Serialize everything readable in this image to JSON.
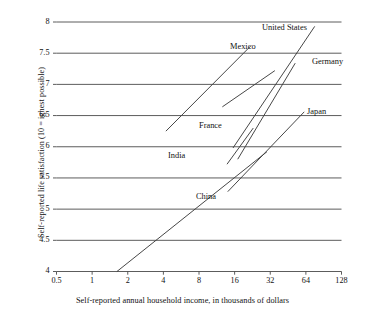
{
  "chart_data": {
    "type": "line",
    "title": "",
    "subtitle": "",
    "xlabel": "Self-reported annual household income, in thousands of dollars",
    "ylabel": "Self-reported life satisfaction (10 = ighest possible)",
    "xscale": "log2",
    "xlim": [
      0.5,
      128
    ],
    "ylim": [
      4,
      8
    ],
    "xticks": [
      "0.5",
      "1",
      "2",
      "4",
      "8",
      "16",
      "32",
      "64",
      "128"
    ],
    "xtick_values": [
      0.5,
      1,
      2,
      4,
      8,
      16,
      32,
      64,
      128
    ],
    "yticks": [
      "4",
      "4.5",
      "5",
      "5.5",
      "6",
      "6.5",
      "7",
      "7.5",
      "8"
    ],
    "ytick_values": [
      4,
      4.5,
      5,
      5.5,
      6,
      6.5,
      7,
      7.5,
      8
    ],
    "grid": "horizontal",
    "legend": "inline-labels",
    "line_color": "#3d3d3d",
    "grid_color": "#4a4a4a",
    "series": [
      {
        "name": "Mexico",
        "label": "Mexico",
        "x": [
          4.2,
          22.0
        ],
        "y": [
          6.25,
          7.62
        ],
        "label_x_px": 230,
        "label_y_px": 42
      },
      {
        "name": "United States",
        "label": "United States",
        "x": [
          15.5,
          76.0
        ],
        "y": [
          5.98,
          7.93
        ],
        "label_x_px": 262,
        "label_y_px": 23
      },
      {
        "name": "Germany",
        "label": "Germany",
        "x": [
          17.0,
          52.0
        ],
        "y": [
          5.8,
          7.34
        ],
        "label_x_px": 312,
        "label_y_px": 57
      },
      {
        "name": "France",
        "label": "France",
        "x": [
          12.6,
          35.0
        ],
        "y": [
          6.64,
          7.22
        ],
        "label_x_px": 199,
        "label_y_px": 121
      },
      {
        "name": "Japan",
        "label": "Japan",
        "x": [
          14.0,
          62.0
        ],
        "y": [
          5.28,
          6.56
        ],
        "label_x_px": 307,
        "label_y_px": 107
      },
      {
        "name": "India",
        "label": "India",
        "x": [
          13.8,
          23.0
        ],
        "y": [
          5.72,
          6.3
        ],
        "label_x_px": 168,
        "label_y_px": 151
      },
      {
        "name": "China",
        "label": "China",
        "x": [
          1.62,
          30.0
        ],
        "y": [
          4.0,
          5.92
        ],
        "label_x_px": 196,
        "label_y_px": 192
      }
    ]
  }
}
